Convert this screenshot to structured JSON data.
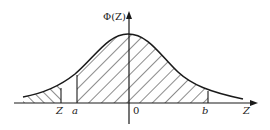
{
  "diagram": {
    "y_axis_label": "Φ(Z)",
    "x_axis_label": "Z",
    "labels": {
      "z_point": "Z",
      "a_point": "a",
      "origin": "0",
      "b_point": "b"
    },
    "shaded_regions": [
      {
        "name": "left-tail",
        "from": "-∞",
        "to": "Z",
        "hatch": "backslash"
      },
      {
        "name": "central",
        "from": "a",
        "to": "b",
        "hatch": "slash"
      }
    ],
    "colors": {
      "ink": "#1a1a1a",
      "background": "#ffffff"
    }
  }
}
